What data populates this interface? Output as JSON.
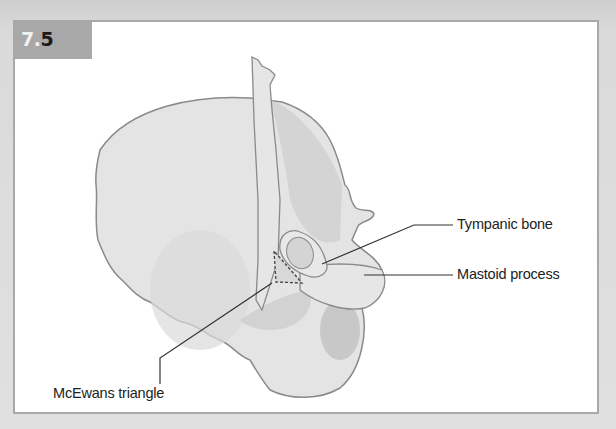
{
  "figure": {
    "number_prefix": "7.",
    "number_suffix": "5"
  },
  "labels": {
    "tympanic_bone": "Tympanic bone",
    "mastoid_process": "Mastoid process",
    "mcewans_triangle": "McEwans triangle"
  },
  "colors": {
    "bone_light": "#e4e4e4",
    "bone_mid": "#d2d2d2",
    "bone_dark": "#c2c2c2",
    "outline": "#8a8a8a",
    "leader_line": "#333333",
    "label_box": "#a8a8a8"
  }
}
